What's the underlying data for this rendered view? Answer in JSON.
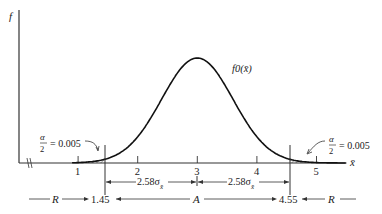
{
  "chart_data": {
    "type": "area",
    "title": "",
    "curve_label": "f0(x̄)",
    "ylabel": "f",
    "xlabel": "x̄",
    "xlim": [
      0,
      6
    ],
    "ticks": [
      1,
      2,
      3,
      4,
      5
    ],
    "tick_labels": [
      "1",
      "2",
      "3",
      "4",
      "5"
    ],
    "distribution": {
      "kind": "normal",
      "mean": 3,
      "sd": 0.6
    },
    "critical_values": [
      1.45,
      4.55
    ],
    "shaded_regions": [
      {
        "from": 0,
        "to": 1.45,
        "label_top": "α",
        "label_bottom": "2",
        "value": "= 0.005",
        "side": "left"
      },
      {
        "from": 4.55,
        "to": 6,
        "label_top": "α",
        "label_bottom": "2",
        "value": "= 0.005",
        "side": "right"
      }
    ],
    "dimension_labels": [
      {
        "text": "2.58σ",
        "sub": "x̄",
        "from": 1.45,
        "to": 3
      },
      {
        "text": "2.58σ",
        "sub": "x̄",
        "from": 3,
        "to": 4.55
      }
    ],
    "regions": [
      {
        "label": "R",
        "from": 0,
        "to": 1.45
      },
      {
        "label": "A",
        "from": 1.45,
        "to": 4.55
      },
      {
        "label": "R",
        "from": 4.55,
        "to": 6
      }
    ],
    "boundary_labels": [
      "1.45",
      "4.55"
    ]
  }
}
